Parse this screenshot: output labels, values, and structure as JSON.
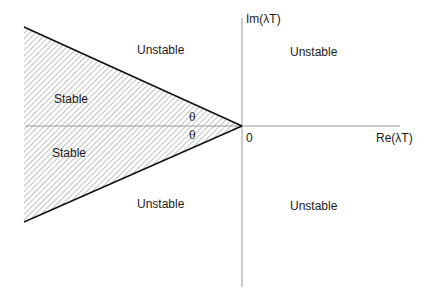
{
  "diagram": {
    "axes": {
      "x_label": "Re(λT)",
      "y_label": "Im(λT)",
      "origin_label": "0"
    },
    "regions": {
      "upper_left": "Unstable",
      "upper_right": "Unstable",
      "lower_left": "Unstable",
      "lower_right": "Unstable",
      "stable_upper": "Stable",
      "stable_lower": "Stable"
    },
    "angle_labels": {
      "upper": "θ",
      "lower": "θ"
    },
    "colors": {
      "axis": "#9a9a9a",
      "boundary": "#111111",
      "hatch": "#777777",
      "background": "#ffffff"
    }
  }
}
